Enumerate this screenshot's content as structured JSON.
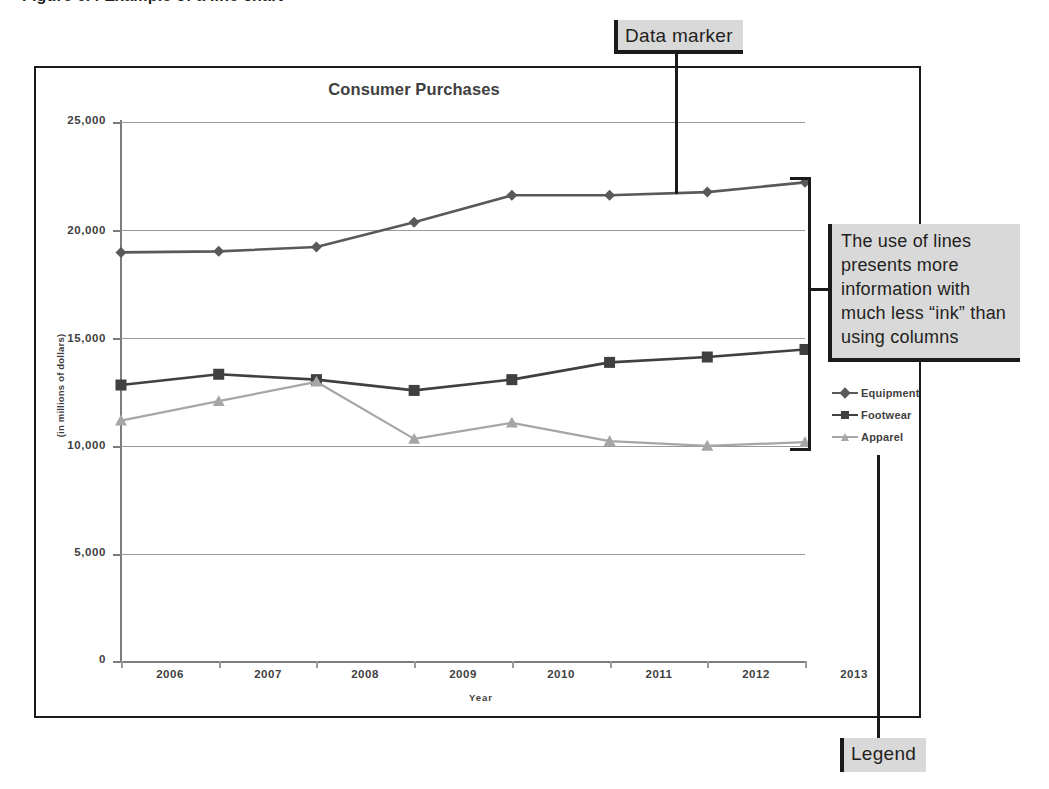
{
  "figure": {
    "caption": "Figure 6.4  Example of a line chart"
  },
  "callouts": {
    "data_marker": "Data marker",
    "legend": "Legend",
    "annotation": "The use of lines presents more information with much less “ink” than using columns"
  },
  "legend": {
    "items": [
      {
        "label": "Equipment",
        "marker": "diamond-marker-icon",
        "color": "#595959"
      },
      {
        "label": "Footwear",
        "marker": "square-marker-icon",
        "color": "#404040"
      },
      {
        "label": "Apparel",
        "marker": "triangle-marker-icon",
        "color": "#a6a6a6"
      }
    ]
  },
  "chart_data": {
    "type": "line",
    "title": "Consumer Purchases",
    "xlabel": "Year",
    "ylabel": "(in millions of dollars)",
    "categories": [
      "2006",
      "2007",
      "2008",
      "2009",
      "2010",
      "2011",
      "2012",
      "2013"
    ],
    "ylim": [
      0,
      25000
    ],
    "yticks": [
      0,
      5000,
      10000,
      15000,
      20000,
      25000
    ],
    "ytick_labels": [
      "0",
      "5,000",
      "10,000",
      "15,000",
      "20,000",
      "25,000"
    ],
    "grid": true,
    "legend_position": "right",
    "series": [
      {
        "name": "Equipment",
        "color": "#595959",
        "marker": "diamond",
        "values": [
          18950,
          19000,
          19200,
          20350,
          21600,
          21600,
          21750,
          22200
        ]
      },
      {
        "name": "Footwear",
        "color": "#404040",
        "marker": "square",
        "values": [
          12800,
          13300,
          13050,
          12550,
          13050,
          13850,
          14100,
          14450
        ]
      },
      {
        "name": "Apparel",
        "color": "#a6a6a6",
        "marker": "triangle",
        "values": [
          11150,
          12050,
          12950,
          10300,
          11050,
          10200,
          9980,
          10150
        ]
      }
    ]
  },
  "colors": {
    "frame": "#1a1a1a",
    "gridline": "#9a9a9a",
    "callout_bg": "#d9d9d9",
    "text": "#231f20"
  }
}
